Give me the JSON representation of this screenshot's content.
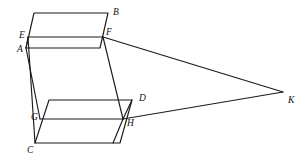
{
  "figure": {
    "type": "geometry-diagram",
    "width": 307,
    "height": 165,
    "background_color": "#ffffff",
    "line_color": "#1a1a1a",
    "label_color": "#111111",
    "vertices": [
      {
        "id": "A",
        "label": "A",
        "x": 26,
        "y": 48,
        "label_x": 17,
        "label_y": 50
      },
      {
        "id": "B",
        "label": "B",
        "x": 108,
        "y": 13,
        "label_x": 113,
        "label_y": 13
      },
      {
        "id": "C",
        "label": "C",
        "x": 35,
        "y": 143,
        "label_x": 27,
        "label_y": 151
      },
      {
        "id": "D",
        "label": "D",
        "x": 132,
        "y": 100,
        "label_x": 139,
        "label_y": 99
      },
      {
        "id": "E",
        "label": "E",
        "x": 28,
        "y": 37,
        "label_x": 19,
        "label_y": 36
      },
      {
        "id": "F",
        "label": "F",
        "x": 103,
        "y": 37,
        "label_x": 106,
        "label_y": 33
      },
      {
        "id": "G",
        "label": "G",
        "x": 40,
        "y": 119,
        "label_x": 31,
        "label_y": 118
      },
      {
        "id": "H",
        "label": "H",
        "x": 123,
        "y": 119,
        "label_x": 127,
        "label_y": 124
      },
      {
        "id": "K",
        "label": "K",
        "x": 283,
        "y": 92,
        "label_x": 288,
        "label_y": 101
      }
    ],
    "upper_plane": {
      "name": "upper-parallelogram-ABFE",
      "top_left_x": 34,
      "top_left_y": 13,
      "top_right_x": 108,
      "top_right_y": 13,
      "bottom_right_x": 100,
      "bottom_right_y": 48,
      "bottom_left_x": 26,
      "bottom_left_y": 48
    },
    "lower_plane": {
      "name": "lower-parallelogram-CDHG",
      "top_left_x": 49,
      "top_left_y": 100,
      "top_right_x": 132,
      "top_right_y": 100,
      "bottom_right_x": 120,
      "bottom_right_y": 143,
      "bottom_left_x": 35,
      "bottom_left_y": 143
    },
    "segments": [
      {
        "name": "segment-EF",
        "from": "E",
        "to": "F"
      },
      {
        "name": "segment-GH",
        "from": "G",
        "to": "H"
      },
      {
        "name": "segment-F-K",
        "from": "F",
        "to": "K"
      },
      {
        "name": "segment-H-K",
        "from": "H",
        "to": "K"
      },
      {
        "name": "segment-A-G",
        "from": "A",
        "to": "G"
      },
      {
        "name": "segment-F-H",
        "from": "F",
        "to": "H"
      },
      {
        "name": "segment-D-H",
        "from": "D",
        "to": "H"
      }
    ]
  }
}
